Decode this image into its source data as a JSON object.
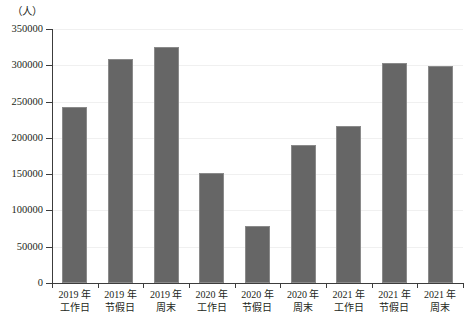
{
  "chart_data": {
    "type": "bar",
    "title": "",
    "subtitle": "",
    "unit_label": "（人）",
    "xlabel": "",
    "ylabel": "",
    "ylim": [
      0,
      350000
    ],
    "y_ticks": [
      0,
      50000,
      100000,
      150000,
      200000,
      250000,
      300000,
      350000
    ],
    "y_tick_labels": [
      "0",
      "50000",
      "100000",
      "150000",
      "200000",
      "250000",
      "300000",
      "350000"
    ],
    "grid": true,
    "legend": null,
    "legend_position": "none",
    "bar_color": "#666666",
    "axis_color": "#3c3c3c",
    "gridline_color": "#f0f0f0",
    "categories": [
      "2019 年工作日",
      "2019 年节假日",
      "2019 年周末",
      "2020 年工作日",
      "2020 年节假日",
      "2020 年周末",
      "2021 年工作日",
      "2021 年节假日",
      "2021 年周末"
    ],
    "category_lines": [
      {
        "line1": "2019 年",
        "line2": "工作日"
      },
      {
        "line1": "2019 年",
        "line2": "节假日"
      },
      {
        "line1": "2019 年",
        "line2": "周末"
      },
      {
        "line1": "2020 年",
        "line2": "工作日"
      },
      {
        "line1": "2020 年",
        "line2": "节假日"
      },
      {
        "line1": "2020 年",
        "line2": "周末"
      },
      {
        "line1": "2021 年",
        "line2": "工作日"
      },
      {
        "line1": "2021 年",
        "line2": "节假日"
      },
      {
        "line1": "2021 年",
        "line2": "周末"
      }
    ],
    "values": [
      242000,
      308000,
      325000,
      152000,
      79000,
      190000,
      217000,
      303000,
      299000
    ]
  }
}
